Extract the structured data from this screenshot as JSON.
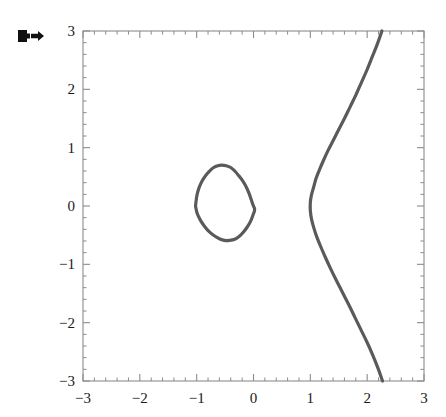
{
  "cell": {
    "marker_icon": "output-cell-arrow-icon"
  },
  "chart_data": {
    "type": "line",
    "title": "",
    "subtitle": "",
    "xlabel": "",
    "ylabel": "",
    "xlim": [
      -3,
      3
    ],
    "ylim": [
      -3,
      3
    ],
    "grid": false,
    "legend": false,
    "legend_position": "none",
    "frame": true,
    "curve_color": "#5a5a5a",
    "frame_color": "#8c8c8c",
    "background_color": "#ffffff",
    "label_color": "#1a1a1a",
    "xticks": [
      -3,
      -2,
      -1,
      0,
      1,
      2,
      3
    ],
    "xtick_labels": [
      "-3",
      "-2",
      "-1",
      "0",
      "1",
      "2",
      "3"
    ],
    "yticks": [
      -3,
      -2,
      -1,
      0,
      1,
      2,
      3
    ],
    "ytick_labels": [
      "-3",
      "-2",
      "-1",
      "0",
      "1",
      "2",
      "3"
    ],
    "minor_ticks_per_interval": 4,
    "series": [
      {
        "name": "oval-component",
        "closed": true,
        "points": [
          [
            -1.02,
            0.0
          ],
          [
            -1.0,
            0.16
          ],
          [
            -0.97,
            0.28
          ],
          [
            -0.93,
            0.38
          ],
          [
            -0.88,
            0.47
          ],
          [
            -0.82,
            0.55
          ],
          [
            -0.76,
            0.61
          ],
          [
            -0.7,
            0.66
          ],
          [
            -0.63,
            0.69
          ],
          [
            -0.56,
            0.7
          ],
          [
            -0.48,
            0.69
          ],
          [
            -0.4,
            0.66
          ],
          [
            -0.33,
            0.6
          ],
          [
            -0.26,
            0.52
          ],
          [
            -0.19,
            0.43
          ],
          [
            -0.13,
            0.33
          ],
          [
            -0.08,
            0.22
          ],
          [
            -0.04,
            0.11
          ],
          [
            -0.01,
            0.02
          ],
          [
            0.02,
            -0.06
          ],
          [
            -0.01,
            -0.16
          ],
          [
            -0.05,
            -0.26
          ],
          [
            -0.11,
            -0.36
          ],
          [
            -0.18,
            -0.45
          ],
          [
            -0.25,
            -0.52
          ],
          [
            -0.33,
            -0.57
          ],
          [
            -0.42,
            -0.59
          ],
          [
            -0.51,
            -0.59
          ],
          [
            -0.6,
            -0.56
          ],
          [
            -0.69,
            -0.51
          ],
          [
            -0.78,
            -0.44
          ],
          [
            -0.86,
            -0.35
          ],
          [
            -0.93,
            -0.25
          ],
          [
            -0.99,
            -0.13
          ],
          [
            -1.02,
            0.0
          ]
        ]
      },
      {
        "name": "right-branch",
        "closed": false,
        "points": [
          [
            2.26,
            3.0
          ],
          [
            2.18,
            2.78
          ],
          [
            2.09,
            2.56
          ],
          [
            2.0,
            2.34
          ],
          [
            1.9,
            2.12
          ],
          [
            1.8,
            1.9
          ],
          [
            1.7,
            1.7
          ],
          [
            1.6,
            1.5
          ],
          [
            1.5,
            1.31
          ],
          [
            1.4,
            1.12
          ],
          [
            1.31,
            0.95
          ],
          [
            1.23,
            0.78
          ],
          [
            1.16,
            0.62
          ],
          [
            1.1,
            0.47
          ],
          [
            1.06,
            0.33
          ],
          [
            1.02,
            0.19
          ],
          [
            1.0,
            0.06
          ],
          [
            1.0,
            -0.08
          ],
          [
            1.02,
            -0.22
          ],
          [
            1.06,
            -0.37
          ],
          [
            1.11,
            -0.52
          ],
          [
            1.18,
            -0.69
          ],
          [
            1.26,
            -0.87
          ],
          [
            1.35,
            -1.06
          ],
          [
            1.45,
            -1.26
          ],
          [
            1.56,
            -1.47
          ],
          [
            1.67,
            -1.68
          ],
          [
            1.78,
            -1.9
          ],
          [
            1.89,
            -2.12
          ],
          [
            2.0,
            -2.34
          ],
          [
            2.1,
            -2.56
          ],
          [
            2.19,
            -2.78
          ],
          [
            2.27,
            -3.0
          ]
        ]
      }
    ]
  }
}
